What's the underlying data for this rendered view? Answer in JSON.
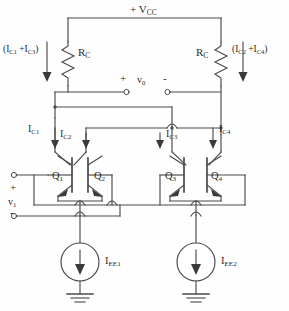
{
  "diagram": {
    "type": "circuit-schematic",
    "stroke_color": "#4a4a4a",
    "text_color": "#2b2b2b",
    "background": "#fefefe"
  },
  "supply": {
    "label_prefix": "+ V",
    "label_sub": "CC"
  },
  "resistors": [
    {
      "name": "rc-left",
      "label": "R",
      "sub": "C"
    },
    {
      "name": "rc-right",
      "label": "R",
      "sub": "C"
    }
  ],
  "supply_currents": [
    {
      "name": "left-branch-current",
      "text": "(I",
      "sub1": "C1",
      "mid": " +I",
      "sub2": "C3",
      "close": ")"
    },
    {
      "name": "right-branch-current",
      "text": "(I",
      "sub1": "C2",
      "mid": " +I",
      "sub2": "C4",
      "close": ")"
    }
  ],
  "collector_currents": [
    {
      "name": "ic1",
      "label": "I",
      "sub": "C1"
    },
    {
      "name": "ic2",
      "label": "I",
      "sub": "C2"
    },
    {
      "name": "ic3",
      "label": "I",
      "sub": "C3"
    },
    {
      "name": "ic4",
      "label": "I",
      "sub": "C4"
    }
  ],
  "transistors": [
    {
      "name": "q1",
      "label": "Q",
      "sub": "1"
    },
    {
      "name": "q2",
      "label": "Q",
      "sub": "2"
    },
    {
      "name": "q3",
      "label": "Q",
      "sub": "3"
    },
    {
      "name": "q4",
      "label": "Q",
      "sub": "4"
    }
  ],
  "current_sources": [
    {
      "name": "iee1",
      "label": "I",
      "sub": "EE1"
    },
    {
      "name": "iee2",
      "label": "I",
      "sub": "EE2"
    }
  ],
  "output_port": {
    "plus": "+",
    "minus": "-",
    "label": "v",
    "sub": "0"
  },
  "input_port": {
    "plus": "+",
    "minus": "-",
    "label": "v",
    "sub": "1"
  }
}
